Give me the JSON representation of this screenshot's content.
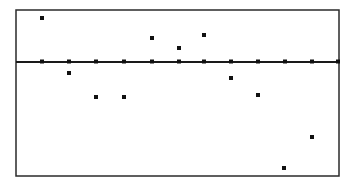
{
  "window": {
    "frame": {
      "left": 16,
      "top": 10,
      "right": 339,
      "bottom": 176
    },
    "x_axis_y": 62,
    "colors": {
      "background": "#ffffff",
      "frame": "#2a2a2a",
      "axis": "#1a1a1a",
      "points": "#111111"
    }
  },
  "chart_data": {
    "type": "scatter",
    "title": "",
    "xlabel": "",
    "ylabel": "",
    "grid": false,
    "legend": null,
    "axis_ticks_x": [
      1,
      2,
      3,
      4,
      5,
      6,
      7,
      8,
      9,
      10,
      11,
      12
    ],
    "series": [
      {
        "name": "data",
        "x": [
          1,
          2,
          3,
          4,
          5,
          6,
          7,
          8,
          9,
          10,
          11
        ],
        "y": [
          3.5,
          -0.9,
          -2.6,
          -2.6,
          1.9,
          1.1,
          2.1,
          -1.2,
          -2.5,
          -8.1,
          -5.8
        ]
      },
      {
        "name": "axis-marks",
        "x": [
          1,
          2,
          3,
          4,
          5,
          6,
          7,
          8,
          9,
          10,
          11,
          12
        ],
        "y": [
          0,
          0,
          0,
          0,
          0,
          0,
          0,
          0,
          0,
          0,
          0,
          0
        ]
      }
    ],
    "pixel_points": [
      [
        42,
        18
      ],
      [
        69,
        73
      ],
      [
        96,
        97
      ],
      [
        124,
        97
      ],
      [
        152,
        38
      ],
      [
        179,
        48
      ],
      [
        204,
        35
      ],
      [
        231,
        78
      ],
      [
        258,
        95
      ],
      [
        284,
        168
      ],
      [
        312,
        137
      ]
    ],
    "axis_tick_pixels_x": [
      42,
      69,
      96,
      124,
      152,
      179,
      204,
      231,
      258,
      285,
      312,
      338
    ]
  }
}
